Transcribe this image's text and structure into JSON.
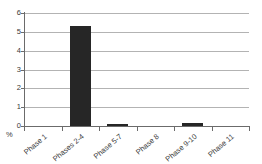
{
  "chart_data": {
    "type": "bar",
    "title": "",
    "xlabel": "",
    "ylabel": "%",
    "categories": [
      "Phase 1",
      "Phases 2-4",
      "Phase 5-7",
      "Phase 8",
      "Phase 9-10",
      "Phase 11"
    ],
    "values": [
      0,
      5.3,
      0.08,
      0,
      0.15,
      0
    ],
    "ylim": [
      0,
      6
    ],
    "yticks": [
      0,
      1,
      2,
      3,
      4,
      5,
      6
    ],
    "ytick_labels": [
      "0",
      "1",
      "2",
      "3",
      "4",
      "5",
      "6"
    ],
    "grid": true,
    "legend": false,
    "legend_position": "none",
    "bar_color": "#262626",
    "grid_color": "#b3b3b3",
    "axis_color": "#6b6b6b",
    "background": "#ffffff",
    "xlabel_rotation": -40
  },
  "axis": {
    "unit_label": "%"
  }
}
